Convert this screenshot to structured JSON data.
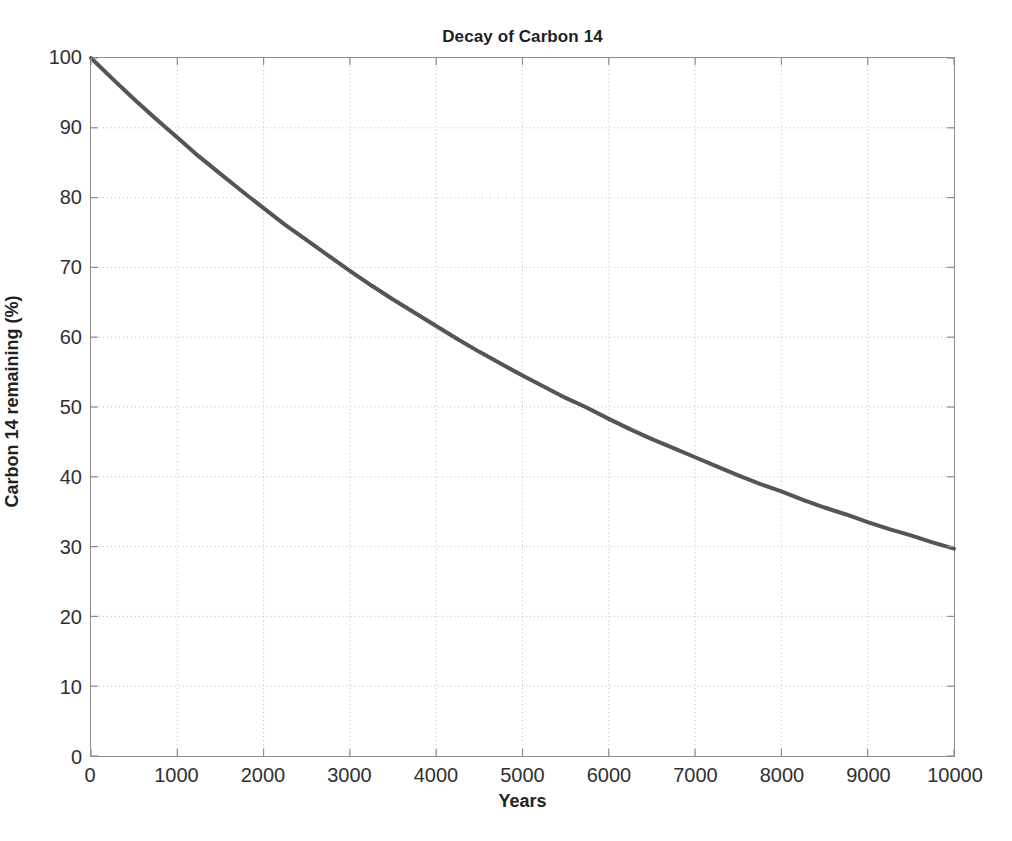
{
  "chart_data": {
    "type": "line",
    "title": "Decay of Carbon 14",
    "xlabel": "Years",
    "ylabel": "Carbon 14 remaining (%)",
    "xlim": [
      0,
      10000
    ],
    "ylim": [
      0,
      100
    ],
    "grid": true,
    "grid_style": "dotted",
    "legend": "none",
    "line_color": "#555555",
    "line_width": 4,
    "xticks": [
      0,
      1000,
      2000,
      3000,
      4000,
      5000,
      6000,
      7000,
      8000,
      9000,
      10000
    ],
    "xtick_labels": [
      "0",
      "1000",
      "2000",
      "3000",
      "4000",
      "5000",
      "6000",
      "7000",
      "8000",
      "9000",
      "10000"
    ],
    "yticks": [
      0,
      10,
      20,
      30,
      40,
      50,
      60,
      70,
      80,
      90,
      100
    ],
    "ytick_labels": [
      "0",
      "10",
      "20",
      "30",
      "40",
      "50",
      "60",
      "70",
      "80",
      "90",
      "100"
    ],
    "series": [
      {
        "name": "Carbon 14 remaining",
        "half_life_years": 5730,
        "x": [
          0,
          250,
          500,
          750,
          1000,
          1250,
          1500,
          1750,
          2000,
          2250,
          2500,
          2750,
          3000,
          3250,
          3500,
          3750,
          4000,
          4250,
          4500,
          4750,
          5000,
          5250,
          5500,
          5730,
          6000,
          6250,
          6500,
          6750,
          7000,
          7250,
          7500,
          7750,
          8000,
          8250,
          8500,
          8750,
          9000,
          9250,
          9500,
          9750,
          10000
        ],
        "y": [
          100.0,
          97.0,
          94.1,
          91.3,
          88.6,
          85.9,
          83.4,
          80.9,
          78.5,
          76.1,
          73.9,
          71.7,
          69.5,
          67.4,
          65.4,
          63.5,
          61.6,
          59.7,
          57.9,
          56.2,
          54.5,
          52.9,
          51.3,
          50.0,
          48.3,
          46.8,
          45.4,
          44.1,
          42.8,
          41.5,
          40.2,
          39.0,
          37.9,
          36.7,
          35.6,
          34.6,
          33.5,
          32.5,
          31.6,
          30.6,
          29.7
        ]
      }
    ]
  },
  "meta": {
    "axis_color": "#8e8e8e",
    "grid_color": "#bdbdbd",
    "text_color": "#303030",
    "background": "#ffffff"
  }
}
